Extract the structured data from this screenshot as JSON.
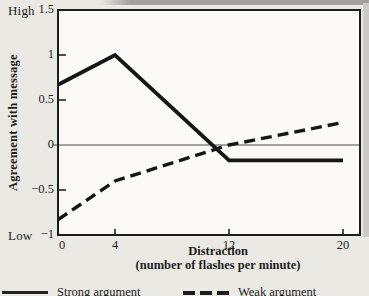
{
  "page": {
    "background": "#eae9e4",
    "plot_background": "#fbfaf6",
    "line_color": "#161616",
    "border_color": "#1d1d1d"
  },
  "chart_data": {
    "type": "line",
    "title": "",
    "xlabel_line1": "Distraction",
    "xlabel_line2": "(number of flashes per minute)",
    "ylabel": "Agreement with message",
    "y_axis_high_label": "High",
    "y_axis_low_label": "Low",
    "xlim": [
      0,
      20
    ],
    "ylim": [
      -1,
      1.5
    ],
    "x_ticks": [
      {
        "x": 0,
        "label": "0"
      },
      {
        "x": 4,
        "label": "4"
      },
      {
        "x": 12,
        "label": "12"
      },
      {
        "x": 20,
        "label": "20"
      }
    ],
    "y_ticks": [
      {
        "v": 1.5,
        "label": "1.5"
      },
      {
        "v": 1,
        "label": "1"
      },
      {
        "v": 0.5,
        "label": "0.5"
      },
      {
        "v": 0,
        "label": "0"
      },
      {
        "v": -0.5,
        "label": "−0.5"
      },
      {
        "v": -1,
        "label": "−1"
      }
    ],
    "zero_line": true,
    "grid": false,
    "legend_position": "bottom",
    "series": [
      {
        "name": "Strong argument",
        "style": "solid",
        "color": "#161616",
        "points": [
          [
            0,
            0.67
          ],
          [
            4,
            1.0
          ],
          [
            12,
            -0.17
          ],
          [
            20,
            -0.17
          ]
        ]
      },
      {
        "name": "Weak argument",
        "style": "dashed",
        "color": "#161616",
        "points": [
          [
            0,
            -0.83
          ],
          [
            4,
            -0.4
          ],
          [
            12,
            0.0
          ],
          [
            20,
            0.25
          ]
        ]
      }
    ],
    "legend": [
      {
        "label": "Strong argument",
        "style": "solid"
      },
      {
        "label": "Weak argument",
        "style": "dashed"
      }
    ]
  }
}
